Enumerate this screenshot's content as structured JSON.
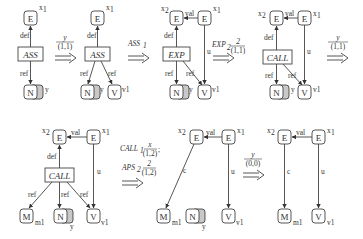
{
  "colors": {
    "stroke": "#444444",
    "shadow_fill": "#c8c8c8",
    "background": "#ffffff"
  },
  "transitions": [
    {
      "id": "t1",
      "label": "y",
      "sub": "(1,1)"
    },
    {
      "id": "t2",
      "label": "ASS",
      "label_sub": "1"
    },
    {
      "id": "t3",
      "label": "EXP",
      "label_sub": "2",
      "frac_num": "2",
      "frac_den": "(1,1)"
    },
    {
      "id": "t4",
      "label": "y",
      "sub": "(1,1)"
    },
    {
      "id": "t5a",
      "label": "CALL",
      "label_sub": "1",
      "frac_num": "x",
      "frac_den": "(1,2)",
      "sep": ";"
    },
    {
      "id": "t5b",
      "label": "APS",
      "label_sub": "2",
      "frac_num": "2",
      "frac_den": "(1,2)"
    },
    {
      "id": "t6",
      "label": "y",
      "sub": "(0,0)"
    }
  ],
  "graphs": [
    {
      "id": "g1",
      "stmt": "ASS",
      "nodes": [
        "E",
        "N"
      ],
      "node_labels": {
        "x1": "x",
        "x1sub": "1",
        "y": "y"
      },
      "edges": [
        "def",
        "ref"
      ]
    },
    {
      "id": "g2",
      "stmt": "ASS",
      "nodes": [
        "E",
        "N",
        "V"
      ],
      "node_labels": {
        "x1": "x",
        "x1sub": "1",
        "y": "y",
        "v1": "v1"
      },
      "edges": [
        "def",
        "ref",
        "ref"
      ]
    },
    {
      "id": "g3",
      "stmt": "EXP",
      "nodes": [
        "E",
        "E",
        "N",
        "V"
      ],
      "node_labels": {
        "x2": "x",
        "x2sub": "2",
        "x1": "x",
        "x1sub": "1",
        "y": "y",
        "v1": "v1"
      },
      "edges": [
        "val",
        "def",
        "u",
        "ref",
        "ref"
      ]
    },
    {
      "id": "g4",
      "stmt": "CALL",
      "nodes": [
        "E",
        "E",
        "N",
        "V"
      ],
      "node_labels": {
        "x2": "x",
        "x2sub": "2",
        "x1": "x",
        "x1sub": "1",
        "y": "y",
        "v1": "v1"
      },
      "edges": [
        "val",
        "def",
        "u",
        "ref",
        "ref"
      ]
    },
    {
      "id": "g5",
      "stmt": "CALL",
      "nodes": [
        "E",
        "E",
        "M",
        "N",
        "V"
      ],
      "node_labels": {
        "x2": "x",
        "x2sub": "2",
        "x1": "x",
        "x1sub": "1",
        "m1": "m1",
        "y": "y",
        "v1": "v1"
      },
      "edges": [
        "val",
        "def",
        "u",
        "ref",
        "ref",
        "ref"
      ]
    },
    {
      "id": "g6",
      "nodes": [
        "E",
        "E",
        "M",
        "N",
        "V"
      ],
      "node_labels": {
        "x2": "x",
        "x2sub": "2",
        "x1": "x",
        "x1sub": "1",
        "m1": "m1",
        "y": "y",
        "v1": "v1"
      },
      "edges": [
        "val",
        "c",
        "u"
      ]
    },
    {
      "id": "g7",
      "nodes": [
        "E",
        "E",
        "M",
        "V"
      ],
      "node_labels": {
        "x2": "x",
        "x2sub": "2",
        "x1": "x",
        "x1sub": "1",
        "m1": "m1",
        "v1": "v1"
      },
      "edges": [
        "val",
        "c",
        "u"
      ]
    }
  ],
  "text": {
    "E": "E",
    "N": "N",
    "V": "V",
    "M": "M",
    "ASS": "ASS",
    "EXP": "EXP",
    "CALL": "CALL",
    "def": "def",
    "ref": "ref",
    "val": "val",
    "u": "u",
    "c": "c",
    "x": "x",
    "one": "1",
    "two": "2",
    "y": "y",
    "v1": "v1",
    "m1": "m1"
  }
}
